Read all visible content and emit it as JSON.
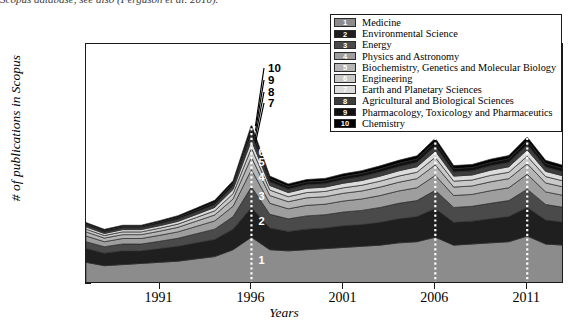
{
  "caption": {
    "text": "Scopus database, see also (Ferguson et al. 2010)."
  },
  "chart_data": {
    "type": "area",
    "stacking": "stacked",
    "title": "",
    "xlabel": "Years",
    "ylabel": "# of publications in Scopus",
    "xlim": [
      1987,
      2013
    ],
    "ylim": [
      0,
      1050
    ],
    "yticks": [
      0,
      200,
      400,
      600,
      800,
      1000
    ],
    "xticks": [
      1991,
      1996,
      2001,
      2006,
      2011
    ],
    "grid": false,
    "legend_position": "top-right",
    "x": [
      1987,
      1988,
      1989,
      1990,
      1991,
      1992,
      1993,
      1994,
      1995,
      1996,
      1997,
      1998,
      1999,
      2000,
      2001,
      2002,
      2003,
      2004,
      2005,
      2006,
      2007,
      2008,
      2009,
      2010,
      2011,
      2012,
      2013
    ],
    "series": [
      {
        "id": 1,
        "name": "Medicine",
        "color": "#8c8c8c",
        "values": [
          95,
          80,
          85,
          90,
          95,
          100,
          110,
          120,
          150,
          205,
          150,
          145,
          150,
          155,
          160,
          165,
          170,
          180,
          185,
          205,
          170,
          175,
          180,
          185,
          210,
          175,
          170
        ]
      },
      {
        "id": 2,
        "name": "Environmental Science",
        "color": "#1f1f1f",
        "values": [
          60,
          55,
          60,
          55,
          60,
          65,
          70,
          75,
          90,
          130,
          95,
          85,
          90,
          90,
          95,
          95,
          100,
          105,
          110,
          125,
          100,
          100,
          105,
          110,
          125,
          105,
          100
        ]
      },
      {
        "id": 3,
        "name": "Energy",
        "color": "#4a4a4a",
        "values": [
          30,
          28,
          30,
          30,
          32,
          35,
          40,
          45,
          55,
          90,
          60,
          55,
          58,
          58,
          60,
          62,
          65,
          68,
          70,
          80,
          65,
          65,
          68,
          70,
          80,
          68,
          65
        ]
      },
      {
        "id": 4,
        "name": "Physics and Astronomy",
        "color": "#9e9e9e",
        "values": [
          25,
          22,
          24,
          24,
          26,
          28,
          32,
          36,
          45,
          75,
          48,
          44,
          46,
          46,
          48,
          50,
          52,
          54,
          56,
          65,
          52,
          52,
          55,
          56,
          65,
          55,
          52
        ]
      },
      {
        "id": 5,
        "name": "Biochemistry, Genetics and Molecular Biology",
        "color": "#b5b5b5",
        "values": [
          18,
          16,
          17,
          17,
          18,
          20,
          23,
          26,
          32,
          55,
          34,
          31,
          33,
          33,
          34,
          35,
          37,
          38,
          40,
          46,
          37,
          37,
          39,
          40,
          46,
          39,
          37
        ]
      },
      {
        "id": 6,
        "name": "Engineering",
        "color": "#c9c9c9",
        "values": [
          12,
          11,
          12,
          12,
          13,
          14,
          16,
          18,
          23,
          40,
          24,
          22,
          23,
          23,
          24,
          25,
          26,
          27,
          28,
          33,
          26,
          26,
          28,
          28,
          33,
          28,
          26
        ]
      },
      {
        "id": 7,
        "name": "Earth and Planetary Sciences",
        "color": "#dcdcdc",
        "values": [
          10,
          9,
          10,
          10,
          11,
          12,
          13,
          15,
          19,
          33,
          20,
          18,
          19,
          19,
          20,
          21,
          22,
          23,
          24,
          28,
          22,
          22,
          23,
          24,
          28,
          23,
          22
        ]
      },
      {
        "id": 8,
        "name": "Agricultural and Biological Sciences",
        "color": "#3d3d3d",
        "values": [
          8,
          7,
          8,
          8,
          9,
          10,
          11,
          12,
          15,
          27,
          16,
          15,
          15,
          15,
          16,
          17,
          18,
          18,
          19,
          22,
          18,
          18,
          19,
          19,
          22,
          19,
          18
        ]
      },
      {
        "id": 9,
        "name": "Pharmacology, Toxicology and Pharmaceutics",
        "color": "#111111",
        "values": [
          6,
          6,
          6,
          6,
          7,
          8,
          9,
          10,
          12,
          22,
          13,
          12,
          12,
          12,
          13,
          14,
          14,
          15,
          15,
          18,
          15,
          15,
          15,
          16,
          18,
          15,
          15
        ]
      },
      {
        "id": 10,
        "name": "Chemistry",
        "color": "#000000",
        "values": [
          5,
          5,
          5,
          5,
          6,
          7,
          8,
          9,
          11,
          20,
          12,
          11,
          11,
          11,
          12,
          12,
          13,
          13,
          14,
          16,
          13,
          13,
          14,
          14,
          16,
          14,
          13
        ]
      }
    ],
    "markers": [
      {
        "year": 1996,
        "style": "white-dotted-vertical"
      },
      {
        "year": 2006,
        "style": "white-dotted-vertical"
      },
      {
        "year": 2011,
        "style": "white-dotted-vertical"
      }
    ],
    "inplot_layer_labels": [
      {
        "num": "1",
        "series": 1
      },
      {
        "num": "2",
        "series": 2
      },
      {
        "num": "3",
        "series": 3
      },
      {
        "num": "4",
        "series": 4
      },
      {
        "num": "5",
        "series": 5
      },
      {
        "num": "6",
        "series": 6
      }
    ],
    "callout_labels": [
      {
        "num": "7",
        "series": 7
      },
      {
        "num": "8",
        "series": 8
      },
      {
        "num": "9",
        "series": 9
      },
      {
        "num": "10",
        "series": 10
      }
    ]
  }
}
